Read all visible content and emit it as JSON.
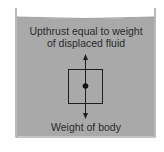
{
  "diagram": {
    "labels": {
      "upthrust_line1": "Upthrust equal to weight",
      "upthrust_line2": "of displaced fluid",
      "weight": "Weight of body"
    },
    "colors": {
      "fluid": "#a9a9a9",
      "container_wall": "#8a8a8a",
      "lines": "#1e1e1e",
      "background": "#ffffff"
    },
    "icons": {
      "up_arrow": "arrow-up-icon",
      "down_arrow": "arrow-down-icon",
      "center_dot": "center-of-mass-dot"
    }
  }
}
